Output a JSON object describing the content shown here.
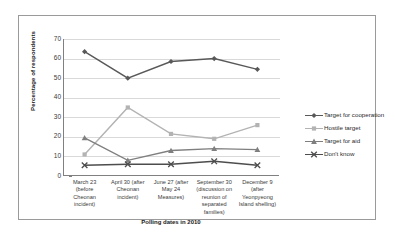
{
  "chart_data": {
    "type": "line",
    "title": "",
    "xlabel": "Polling dates in 2010",
    "ylabel": "Percentage of respondents",
    "ylim": [
      0,
      70
    ],
    "yticks": [
      0,
      10,
      20,
      30,
      40,
      50,
      60,
      70
    ],
    "grid": true,
    "legend_position": "right",
    "categories": [
      "March 23 (before Cheonan incident)",
      "April 30 (after Cheonan incident)",
      "June 27 (after May 24 Measures)",
      "September 30 (discussion on reunion of separated families)",
      "December 9 (after Yeonpyeong Island shelling)"
    ],
    "category_lines": [
      [
        "March 23",
        "(before",
        "Cheonan",
        "incident)"
      ],
      [
        "April 30 (after",
        "Cheonan",
        "incident)"
      ],
      [
        "June 27 (after",
        "May 24",
        "Measures)"
      ],
      [
        "September 30",
        "(discussion on",
        "reunion of",
        "separated",
        "families)"
      ],
      [
        "December 9",
        "(after",
        "Yeonpyeong",
        "Island shelling)"
      ]
    ],
    "series": [
      {
        "name": "Target for cooperation",
        "color": "#595959",
        "marker": "diamond",
        "values": [
          63.5,
          50,
          58.5,
          60,
          54.5
        ]
      },
      {
        "name": "Hostile target",
        "color": "#b3b3b3",
        "marker": "square",
        "values": [
          11,
          35,
          21.5,
          19,
          26
        ]
      },
      {
        "name": "Target for aid",
        "color": "#7f7f7f",
        "marker": "triangle",
        "values": [
          19.5,
          8,
          13,
          14,
          13.5
        ]
      },
      {
        "name": "Don't know",
        "color": "#4d4d4d",
        "marker": "x",
        "values": [
          5.5,
          6,
          6,
          7.5,
          5.5
        ]
      }
    ]
  }
}
